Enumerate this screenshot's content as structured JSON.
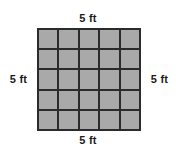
{
  "figure": {
    "shape": "square",
    "grid": {
      "rows": 5,
      "columns": 5,
      "total_cells": 25,
      "cell_fill_color": "#a9a9a9",
      "grid_line_color": "#2b2b2b",
      "background_color": "#ffffff"
    },
    "labels": {
      "top": "5 ft",
      "right": "5 ft",
      "bottom": "5 ft",
      "left": "5 ft"
    }
  },
  "chart_data": {
    "type": "table",
    "title": "",
    "xlabel": "",
    "ylabel": "",
    "rows": 5,
    "columns": 5,
    "cell_values": [
      [
        "",
        "",
        "",
        "",
        ""
      ],
      [
        "",
        "",
        "",
        "",
        ""
      ],
      [
        "",
        "",
        "",
        "",
        ""
      ],
      [
        "",
        "",
        "",
        "",
        ""
      ],
      [
        "",
        "",
        "",
        "",
        ""
      ]
    ],
    "annotations": [
      "5 ft",
      "5 ft",
      "5 ft",
      "5 ft"
    ]
  }
}
